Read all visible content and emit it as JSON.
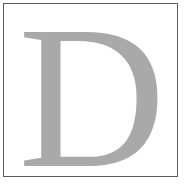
{
  "glyph": {
    "text": "D",
    "color": "#a9a9a9"
  },
  "frame": {
    "border_color": "#5a5a5a",
    "background": "#ffffff"
  }
}
